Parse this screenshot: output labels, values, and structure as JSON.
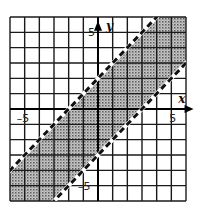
{
  "chart_data": {
    "type": "area",
    "title": "",
    "xlabel": "x",
    "ylabel": "y",
    "xlim": [
      -6,
      6
    ],
    "ylim": [
      -6,
      6
    ],
    "grid": true,
    "grid_step": 1,
    "x_tick_labels": [
      {
        "value": -5,
        "label": "-5"
      },
      {
        "value": 5,
        "label": "5"
      }
    ],
    "y_tick_labels": [
      {
        "value": 5,
        "label": "5"
      },
      {
        "value": -5,
        "label": "-5"
      }
    ],
    "boundary_lines": [
      {
        "name": "upper",
        "equation": "y = x + 2",
        "slope": 1,
        "intercept": 2,
        "style": "dashed"
      },
      {
        "name": "lower",
        "equation": "y = x - 3",
        "slope": 1,
        "intercept": -3,
        "style": "dashed"
      }
    ],
    "shaded_region": "x - 3 < y < x + 2",
    "colors": {
      "grid": "#1a1a1a",
      "shade": "#9a9a9a",
      "shade_dot": "#555555",
      "line": "#111111"
    }
  }
}
